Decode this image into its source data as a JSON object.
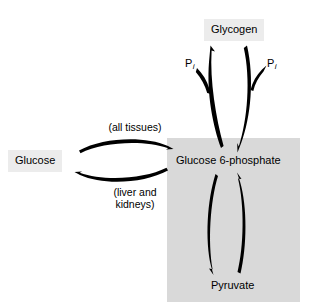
{
  "diagram": {
    "shaded_panel": {
      "name": "cell-interior-panel",
      "color": "#d9d9d9",
      "x": 167,
      "y": 138,
      "width": 133,
      "height": 164
    },
    "background_color": "#ffffff",
    "stroke_color": "#000000",
    "node_box_color": "#ececec"
  },
  "nodes": {
    "glycogen": {
      "label": "Glycogen",
      "boxed": true
    },
    "glucose": {
      "label": "Glucose",
      "boxed": true
    },
    "glucose_6_phosphate": {
      "label": "Glucose 6-phosphate",
      "boxed": false
    },
    "pyruvate": {
      "label": "Pyruvate",
      "boxed": false
    }
  },
  "annotations": {
    "all_tissues": "(all tissues)",
    "liver_and_kidneys_line1": "(liver and",
    "liver_and_kidneys_line2": "kidneys)"
  },
  "cofactors": {
    "pi_left_symbol": "P",
    "pi_left_subscript": "i",
    "pi_right_symbol": "P",
    "pi_right_subscript": "i"
  },
  "arrows": [
    {
      "name": "glucose-to-g6p",
      "from": "glucose",
      "to": "glucose_6_phosphate",
      "direction": "right",
      "annotation": "(all tissues)"
    },
    {
      "name": "g6p-to-glucose",
      "from": "glucose_6_phosphate",
      "to": "glucose",
      "direction": "left",
      "annotation": "(liver and kidneys)"
    },
    {
      "name": "g6p-to-glycogen",
      "from": "glucose_6_phosphate",
      "to": "glycogen",
      "direction": "up",
      "cofactor": "Pi"
    },
    {
      "name": "glycogen-to-g6p",
      "from": "glycogen",
      "to": "glucose_6_phosphate",
      "direction": "down",
      "cofactor": "Pi"
    },
    {
      "name": "g6p-to-pyruvate",
      "from": "glucose_6_phosphate",
      "to": "pyruvate",
      "direction": "down"
    },
    {
      "name": "pyruvate-to-g6p",
      "from": "pyruvate",
      "to": "glucose_6_phosphate",
      "direction": "up"
    }
  ]
}
